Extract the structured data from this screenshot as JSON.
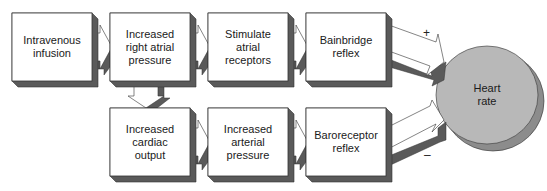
{
  "diagram": {
    "type": "flowchart",
    "nodes": [
      {
        "id": "iv",
        "label": "Intravenous\ninfusion"
      },
      {
        "id": "rap",
        "label": "Increased\nright atrial\npressure"
      },
      {
        "id": "sar",
        "label": "Stimulate\natrial\nreceptors"
      },
      {
        "id": "bain",
        "label": "Bainbridge\nreflex"
      },
      {
        "id": "co",
        "label": "Increased\ncardiac\noutput"
      },
      {
        "id": "ap",
        "label": "Increased\narterial\npressure"
      },
      {
        "id": "baro",
        "label": "Baroreceptor\nreflex"
      },
      {
        "id": "hr",
        "label": "Heart\nrate"
      }
    ],
    "edges": [
      {
        "from": "iv",
        "to": "rap"
      },
      {
        "from": "rap",
        "to": "sar"
      },
      {
        "from": "sar",
        "to": "bain"
      },
      {
        "from": "bain",
        "to": "hr",
        "sign": "+"
      },
      {
        "from": "rap",
        "to": "co"
      },
      {
        "from": "co",
        "to": "ap"
      },
      {
        "from": "ap",
        "to": "baro"
      },
      {
        "from": "baro",
        "to": "hr",
        "sign": "–"
      }
    ],
    "signs": {
      "plus": "+",
      "minus": "–"
    },
    "colors": {
      "box_face": "#ffffff",
      "box_shadow": "#5a5a5a",
      "circle_fill": "#b8b8b8",
      "circle_shadow": "#8c8c8c",
      "outline": "#333333"
    }
  }
}
